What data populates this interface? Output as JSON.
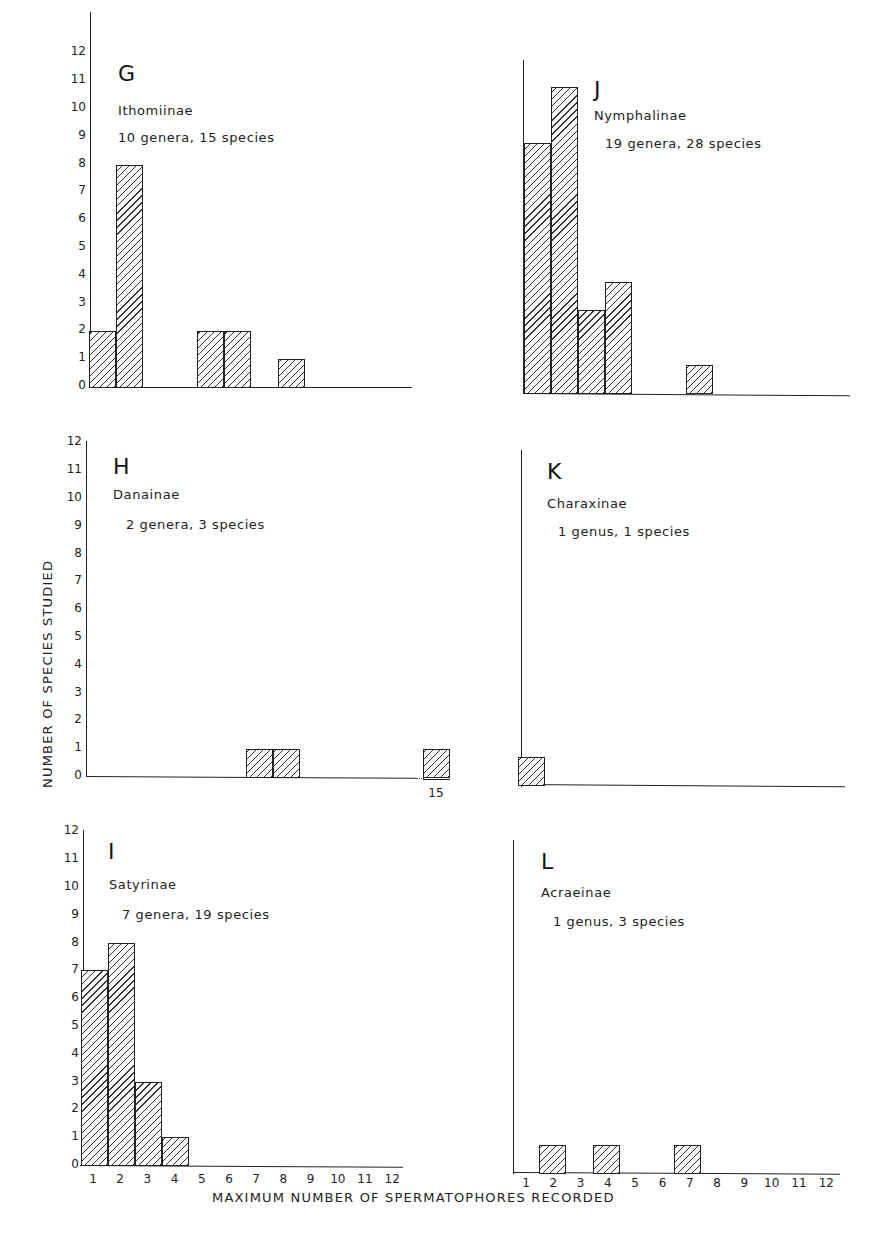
{
  "page": {
    "header_fragment": "32"
  },
  "axis_labels": {
    "y": "NUMBER OF SPECIES STUDIED",
    "x": "MAXIMUM NUMBER OF SPERMATOPHORES RECORDED"
  },
  "y_ticks": [
    "0",
    "1",
    "2",
    "3",
    "4",
    "5",
    "6",
    "7",
    "8",
    "9",
    "10",
    "11",
    "12"
  ],
  "x_ticks": [
    "1",
    "2",
    "3",
    "4",
    "5",
    "6",
    "7",
    "8",
    "9",
    "10",
    "11",
    "12"
  ],
  "panels": {
    "G": {
      "letter": "G",
      "subfamily": "Ithomiinae",
      "counts": "10 genera, 15 species"
    },
    "J": {
      "letter": "J",
      "subfamily": "Nymphalinae",
      "counts": "19 genera, 28 species"
    },
    "H": {
      "letter": "H",
      "subfamily": "Danainae",
      "counts": "2 genera, 3 species",
      "break_tick": "15"
    },
    "K": {
      "letter": "K",
      "subfamily": "Charaxinae",
      "counts": "1 genus, 1 species"
    },
    "I": {
      "letter": "I",
      "subfamily": "Satyrinae",
      "counts": "7 genera, 19 species"
    },
    "L": {
      "letter": "L",
      "subfamily": "Acraeinae",
      "counts": "1 genus, 3 species"
    }
  },
  "chart_data": [
    {
      "type": "bar",
      "title": "G — Ithomiinae (10 genera, 15 species)",
      "xlabel": "Maximum number of spermatophores recorded",
      "ylabel": "Number of species studied",
      "categories": [
        1,
        2,
        3,
        4,
        5,
        6,
        7,
        8,
        9,
        10,
        11,
        12
      ],
      "values": [
        2,
        8,
        0,
        0,
        2,
        2,
        0,
        1,
        0,
        0,
        0,
        0
      ],
      "ylim": [
        0,
        12
      ]
    },
    {
      "type": "bar",
      "title": "J — Nymphalinae (19 genera, 28 species)",
      "xlabel": "Maximum number of spermatophores recorded",
      "ylabel": "Number of species studied",
      "categories": [
        1,
        2,
        3,
        4,
        5,
        6,
        7,
        8,
        9,
        10,
        11,
        12
      ],
      "values": [
        9,
        11,
        3,
        4,
        0,
        0,
        1,
        0,
        0,
        0,
        0,
        0
      ],
      "ylim": [
        0,
        12
      ]
    },
    {
      "type": "bar",
      "title": "H — Danainae (2 genera, 3 species)",
      "xlabel": "Maximum number of spermatophores recorded",
      "ylabel": "Number of species studied",
      "categories": [
        1,
        2,
        3,
        4,
        5,
        6,
        7,
        8,
        9,
        10,
        11,
        12,
        15
      ],
      "values": [
        0,
        0,
        0,
        0,
        0,
        0,
        1,
        1,
        0,
        0,
        0,
        0,
        1
      ],
      "ylim": [
        0,
        12
      ],
      "annotations": [
        "Broken x-axis; extra bar at 15"
      ]
    },
    {
      "type": "bar",
      "title": "K — Charaxinae (1 genus, 1 species)",
      "xlabel": "Maximum number of spermatophores recorded",
      "ylabel": "Number of species studied",
      "categories": [
        1,
        2,
        3,
        4,
        5,
        6,
        7,
        8,
        9,
        10,
        11,
        12
      ],
      "values": [
        1,
        0,
        0,
        0,
        0,
        0,
        0,
        0,
        0,
        0,
        0,
        0
      ],
      "ylim": [
        0,
        12
      ]
    },
    {
      "type": "bar",
      "title": "I — Satyrinae (7 genera, 19 species)",
      "xlabel": "Maximum number of spermatophores recorded",
      "ylabel": "Number of species studied",
      "categories": [
        1,
        2,
        3,
        4,
        5,
        6,
        7,
        8,
        9,
        10,
        11,
        12
      ],
      "values": [
        7,
        8,
        3,
        1,
        0,
        0,
        0,
        0,
        0,
        0,
        0,
        0
      ],
      "ylim": [
        0,
        12
      ]
    },
    {
      "type": "bar",
      "title": "L — Acraeinae (1 genus, 3 species)",
      "xlabel": "Maximum number of spermatophores recorded",
      "ylabel": "Number of species studied",
      "categories": [
        1,
        2,
        3,
        4,
        5,
        6,
        7,
        8,
        9,
        10,
        11,
        12
      ],
      "values": [
        0,
        1,
        0,
        1,
        0,
        0,
        1,
        0,
        0,
        0,
        0,
        0
      ],
      "ylim": [
        0,
        12
      ]
    }
  ]
}
